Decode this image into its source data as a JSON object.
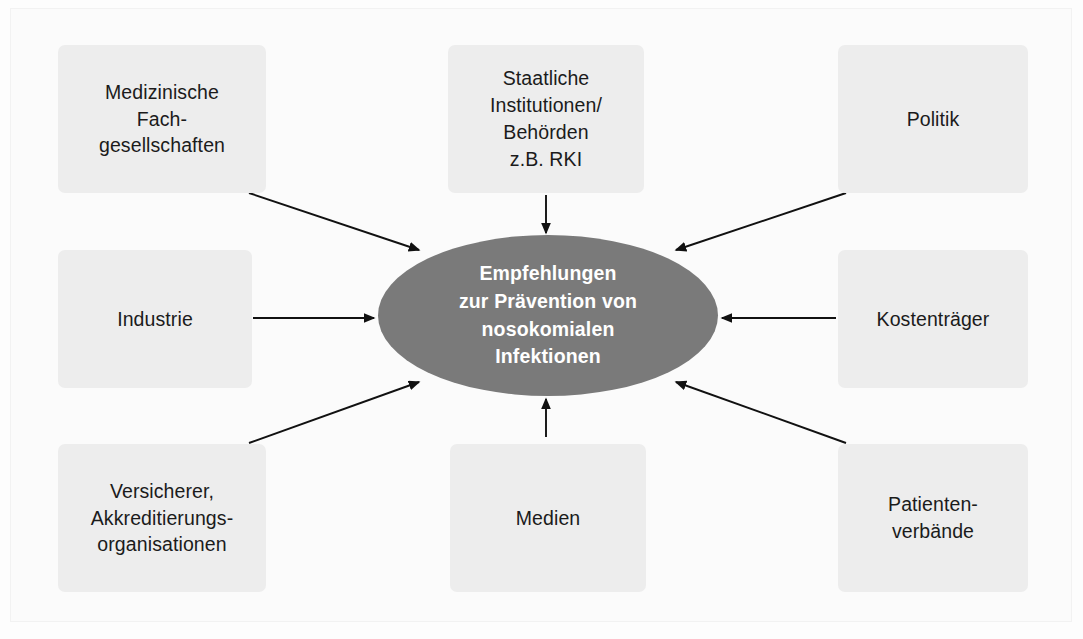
{
  "diagram": {
    "type": "influence-diagram",
    "center": {
      "id": "center-node",
      "label": "Empfehlungen\nzur Prävention von\nnosokomialen\nInfektionen",
      "shape": "ellipse",
      "fill_color": "#7a7a7a",
      "text_color": "#ffffff"
    },
    "node_fill_color": "#ededed",
    "node_text_color": "#1b1b1b",
    "arrow_color": "#111111",
    "nodes": [
      {
        "id": "medizinische-fachgesellschaften",
        "label": "Medizinische\nFach-\ngesellschaften",
        "position": "top-left",
        "x": 58,
        "y": 45,
        "w": 208,
        "h": 148
      },
      {
        "id": "staatliche-institutionen",
        "label": "Staatliche\nInstitutionen/\nBehörden\nz.B. RKI",
        "position": "top-center",
        "x": 448,
        "y": 45,
        "w": 196,
        "h": 148
      },
      {
        "id": "politik",
        "label": "Politik",
        "position": "top-right",
        "x": 838,
        "y": 45,
        "w": 190,
        "h": 148
      },
      {
        "id": "industrie",
        "label": "Industrie",
        "position": "middle-left",
        "x": 58,
        "y": 250,
        "w": 194,
        "h": 138
      },
      {
        "id": "kostentraeger",
        "label": "Kostenträger",
        "position": "middle-right",
        "x": 838,
        "y": 250,
        "w": 190,
        "h": 138
      },
      {
        "id": "versicherer-akkreditierungsorganisationen",
        "label": "Versicherer,\nAkkreditierungs-\norganisationen",
        "position": "bottom-left",
        "x": 58,
        "y": 444,
        "w": 208,
        "h": 148
      },
      {
        "id": "medien",
        "label": "Medien",
        "position": "bottom-center",
        "x": 450,
        "y": 444,
        "w": 196,
        "h": 148
      },
      {
        "id": "patientenverbaende",
        "label": "Patienten-\nverbände",
        "position": "bottom-right",
        "x": 838,
        "y": 444,
        "w": 190,
        "h": 148
      }
    ],
    "arrows": [
      {
        "id": "arrow-medizinische-fachgesellschaften",
        "from": "medizinische-fachgesellschaften",
        "to": "center-node",
        "x1": 249,
        "y1": 193,
        "x2": 419,
        "y2": 250
      },
      {
        "id": "arrow-staatliche-institutionen",
        "from": "staatliche-institutionen",
        "to": "center-node",
        "x1": 546,
        "y1": 195,
        "x2": 546,
        "y2": 233
      },
      {
        "id": "arrow-politik",
        "from": "politik",
        "to": "center-node",
        "x1": 846,
        "y1": 193,
        "x2": 676,
        "y2": 250
      },
      {
        "id": "arrow-industrie",
        "from": "industrie",
        "to": "center-node",
        "x1": 253,
        "y1": 318,
        "x2": 374,
        "y2": 318
      },
      {
        "id": "arrow-kostentraeger",
        "from": "kostentraeger",
        "to": "center-node",
        "x1": 836,
        "y1": 318,
        "x2": 722,
        "y2": 318
      },
      {
        "id": "arrow-versicherer",
        "from": "versicherer-akkreditierungsorganisationen",
        "to": "center-node",
        "x1": 249,
        "y1": 443,
        "x2": 419,
        "y2": 382
      },
      {
        "id": "arrow-medien",
        "from": "medien",
        "to": "center-node",
        "x1": 546,
        "y1": 437,
        "x2": 546,
        "y2": 399
      },
      {
        "id": "arrow-patientenverbaende",
        "from": "patientenverbaende",
        "to": "center-node",
        "x1": 846,
        "y1": 443,
        "x2": 676,
        "y2": 382
      }
    ]
  }
}
